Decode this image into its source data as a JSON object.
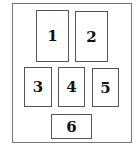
{
  "diagram": {
    "boxes": [
      {
        "label": "1"
      },
      {
        "label": "2"
      },
      {
        "label": "3"
      },
      {
        "label": "4"
      },
      {
        "label": "5"
      },
      {
        "label": "6"
      }
    ]
  }
}
